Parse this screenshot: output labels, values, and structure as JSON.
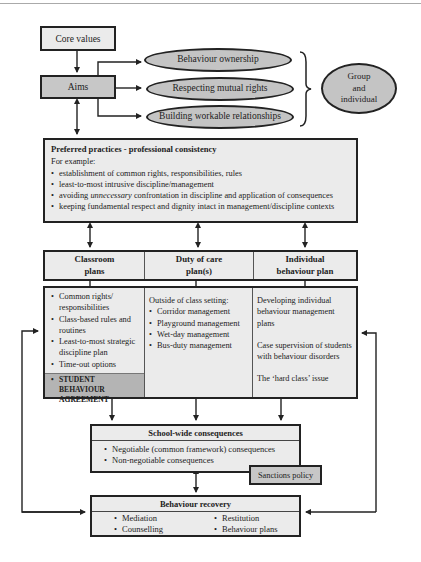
{
  "diagram": {
    "core_values": "Core values",
    "aims": "Aims",
    "aims_outcomes": [
      "Behaviour ownership",
      "Respecting mutual rights",
      "Building workable relationships"
    ],
    "group_individual": {
      "line1": "Group",
      "line2": "and",
      "line3": "individual"
    },
    "preferred_practices": {
      "title": "Preferred practices - professional consistency",
      "intro": "For example:",
      "items": [
        "establishment of common rights, responsibilities, rules",
        "least-to-most intrusive discipline/management",
        "avoiding ",
        "keeping fundamental respect and dignity intact in management/discipline contexts"
      ],
      "item3_emph": "unnecessary",
      "item3_rest": " confrontation in discipline and application of consequences"
    },
    "plans": {
      "headers": [
        {
          "line1": "Classroom",
          "line2": "plans"
        },
        {
          "line1": "Duty of care",
          "line2": "plan(s)"
        },
        {
          "line1": "Individual",
          "line2": "behaviour plan"
        }
      ],
      "classroom_items": [
        "Common rights/ responsibilities",
        "Class-based rules and routines",
        "Least-to-most strategic discipline plan",
        "Time-out options"
      ],
      "student_agreement": "STUDENT BEHAVIOUR AGREEMENT",
      "duty_intro": "Outside of class setting:",
      "duty_items": [
        "Corridor management",
        "Playground management",
        "Wet-day management",
        "Bus-duty management"
      ],
      "individual_paragraphs": [
        "Developing individual behaviour management plans",
        "Case supervision of students with behaviour disorders",
        "The ‘hard class’ issue"
      ]
    },
    "school_wide": {
      "title": "School-wide consequences",
      "items": [
        "Negotiable (common framework) consequences",
        "Non-negotiable consequences"
      ]
    },
    "sanctions_policy": "Sanctions policy",
    "behaviour_recovery": {
      "title": "Behaviour recovery",
      "items": [
        "Mediation",
        "Restitution",
        "Counselling",
        "Behaviour plans"
      ]
    },
    "colors": {
      "light_fill": "#ebebeb",
      "mid_fill": "#c7c7c7",
      "oval_fill": "#c4c4c4",
      "agreement_fill": "#b4b4b4",
      "stroke": "#222222"
    }
  }
}
